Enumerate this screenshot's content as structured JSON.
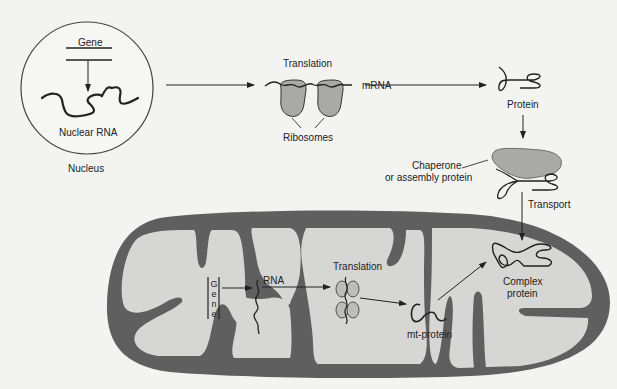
{
  "diagram": {
    "colors": {
      "background": "#f3f3f1",
      "membrane": "#5f5f5f",
      "matrix": "#d6d6d4",
      "ribosome": "#a9a9a7",
      "chaperone": "#a9a9a7",
      "line": "#222222"
    },
    "nucleus": {
      "label": "Nucleus",
      "gene_label": "Gene",
      "rna_label": "Nuclear RNA"
    },
    "cytoplasm": {
      "translation_label": "Translation",
      "mrna_label": "mRNA",
      "ribosomes_label": "Ribosomes",
      "protein_label": "Protein",
      "chaperone_label_line1": "Chaperone",
      "chaperone_label_line2": "or assembly protein",
      "transport_label": "Transport"
    },
    "mitochondrion": {
      "gene_letters": [
        "G",
        "e",
        "n",
        "e"
      ],
      "rna_label": "RNA",
      "translation_label": "Translation",
      "mt_protein_label": "mt-protein",
      "complex_label_line1": "Complex",
      "complex_label_line2": "protein"
    }
  }
}
